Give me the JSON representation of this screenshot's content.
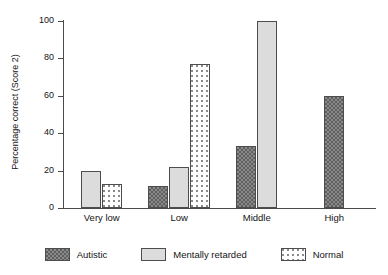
{
  "chart_data": {
    "type": "bar",
    "title": "",
    "subtitle": "",
    "xlabel": "",
    "ylabel": "Percentage correct (Score 2)",
    "categories": [
      "Very low",
      "Low",
      "Middle",
      "High"
    ],
    "series": [
      {
        "name": "Autistic",
        "values": [
          null,
          12,
          33,
          60
        ]
      },
      {
        "name": "Mentally retarded",
        "values": [
          20,
          22,
          100,
          null
        ]
      },
      {
        "name": "Normal",
        "values": [
          13,
          77,
          null,
          null
        ]
      }
    ],
    "ylim": [
      0,
      100
    ],
    "yticks": [
      0,
      20,
      40,
      60,
      80,
      100
    ],
    "ytick_labels": [
      "0",
      "20",
      "40",
      "60",
      "80",
      "100"
    ],
    "grid": false,
    "legend_position": "bottom",
    "colors": {
      "autistic": "#8a8a8a",
      "mentally_retarded": "#dcdcdc",
      "normal": "#ffffff",
      "axis": "#4a4a4a",
      "text": "#141414",
      "background": "#ffffff"
    },
    "patterns": {
      "autistic": "dark-checkered",
      "mentally_retarded": "solid-light-gray",
      "normal": "white-dotted"
    }
  },
  "axis": {
    "y_title": "Percentage correct (Score 2)",
    "ticks": [
      {
        "value": 100,
        "label": "100"
      },
      {
        "value": 80,
        "label": "80"
      },
      {
        "value": 60,
        "label": "60"
      },
      {
        "value": 40,
        "label": "40"
      },
      {
        "value": 20,
        "label": "20"
      },
      {
        "value": 0,
        "label": "0"
      }
    ]
  },
  "xaxis": {
    "labels": [
      "Very low",
      "Low",
      "Middle",
      "High"
    ]
  },
  "legend": {
    "items": [
      {
        "label": "Autistic",
        "pattern": "dark-checkered"
      },
      {
        "label": "Mentally retarded",
        "pattern": "solid-light-gray"
      },
      {
        "label": "Normal",
        "pattern": "white-dotted"
      }
    ]
  }
}
